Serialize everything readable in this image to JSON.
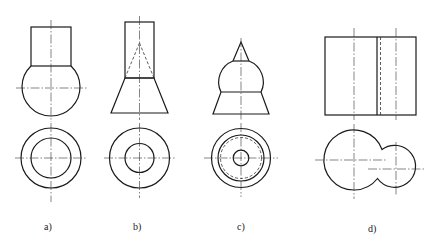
{
  "figure": {
    "colors": {
      "line": "#1a1a1a",
      "background": "#ffffff"
    },
    "panels": [
      {
        "id": "a",
        "label": "a)",
        "description": "Cylinder on sphere: front view and top view"
      },
      {
        "id": "b",
        "label": "b)",
        "description": "Cylinder on truncated cone with hidden cone: front view and top view"
      },
      {
        "id": "c",
        "label": "c)",
        "description": "Cone on sphere on truncated cone: front view and top view with hidden circle"
      },
      {
        "id": "d",
        "label": "d)",
        "description": "Two intersecting cylinders: front view and top view"
      }
    ]
  }
}
